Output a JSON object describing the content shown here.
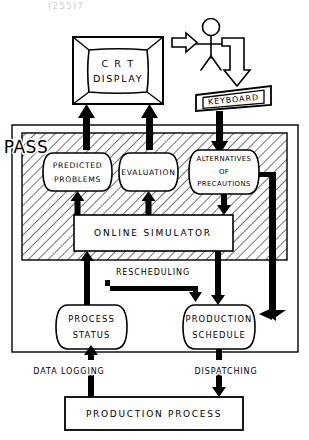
{
  "figure": {
    "top_artifact": "(255)7",
    "colors": {
      "stroke": "#000000",
      "background": "#ffffff",
      "hatch": "#000000",
      "artifact": "#cfcfcf"
    }
  },
  "devices": {
    "crt": {
      "line1": "C R T",
      "line2": "DISPLAY"
    },
    "keyboard": {
      "label": "KEYBOARD"
    },
    "operator": {
      "label": "operator-stick-figure"
    }
  },
  "pass": {
    "label": "PASS",
    "nodes": [
      {
        "id": "predicted-problems",
        "line1": "PREDICTED",
        "line2": "PROBLEMS"
      },
      {
        "id": "evaluation",
        "line1": "EVALUATION",
        "line2": ""
      },
      {
        "id": "alternatives-of-precautions",
        "line1": "ALTERNATIVES",
        "line2": "OF",
        "line3": "PRECAUTIONS"
      }
    ],
    "simulator": {
      "label": "ONLINE   SIMULATOR"
    }
  },
  "stores": [
    {
      "id": "process-status",
      "line1": "PROCESS",
      "line2": "STATUS"
    },
    {
      "id": "production-schedule",
      "line1": "PRODUCTION",
      "line2": "SCHEDULE"
    }
  ],
  "edges": {
    "rescheduling": "RESCHEDULING",
    "data_logging": "DATA  LOGGING",
    "dispatching": "DISPATCHING"
  },
  "process": {
    "label": "PRODUCTION   PROCESS"
  }
}
